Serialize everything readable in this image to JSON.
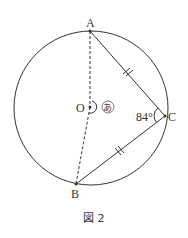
{
  "figure": {
    "caption": "図 2",
    "points": {
      "A": {
        "label": "A",
        "x": 90,
        "y": 31
      },
      "B": {
        "label": "B",
        "x": 76,
        "y": 184
      },
      "C": {
        "label": "C",
        "x": 165,
        "y": 116
      },
      "O": {
        "label": "O",
        "x": 90,
        "y": 107
      }
    },
    "circle": {
      "cx": 91,
      "cy": 108,
      "r": 77
    },
    "angle_C_label": "84°",
    "angle_O_label": "あ",
    "equal_marks": "AC = BC",
    "colors": {
      "stroke": "#333333",
      "background": "#ffffff"
    }
  }
}
